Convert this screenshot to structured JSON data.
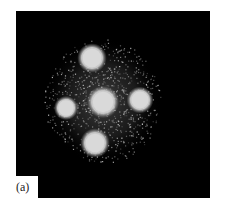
{
  "figure": {
    "panel_label": "(a)",
    "background_color": "#000000",
    "page_color": "#ffffff",
    "spot_color": "#d9d9d9",
    "spots": [
      {
        "name": "top",
        "cx": 76,
        "cy": 47,
        "r": 11
      },
      {
        "name": "left",
        "cx": 50,
        "cy": 97,
        "r": 9
      },
      {
        "name": "center",
        "cx": 87,
        "cy": 91,
        "r": 12
      },
      {
        "name": "right",
        "cx": 124,
        "cy": 89,
        "r": 10
      },
      {
        "name": "bottom",
        "cx": 79,
        "cy": 132,
        "r": 11
      }
    ]
  }
}
